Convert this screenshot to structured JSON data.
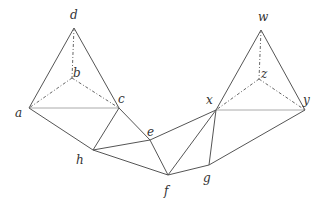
{
  "points": {
    "d": {
      "x": 74,
      "y": 28,
      "lx": 70,
      "ly": 8
    },
    "b": {
      "x": 72,
      "y": 78,
      "lx": 73,
      "ly": 66
    },
    "a": {
      "x": 29,
      "y": 108,
      "lx": 15,
      "ly": 106
    },
    "c": {
      "x": 119,
      "y": 108,
      "lx": 118,
      "ly": 92
    },
    "h": {
      "x": 93,
      "y": 150,
      "lx": 76,
      "ly": 153
    },
    "e": {
      "x": 150,
      "y": 140,
      "lx": 147,
      "ly": 125
    },
    "f": {
      "x": 168,
      "y": 175,
      "lx": 164,
      "ly": 184
    },
    "g": {
      "x": 209,
      "y": 165,
      "lx": 203,
      "ly": 171
    },
    "x": {
      "x": 216,
      "y": 110,
      "lx": 206,
      "ly": 93
    },
    "y": {
      "x": 305,
      "y": 110,
      "lx": 303,
      "ly": 93
    },
    "w": {
      "x": 261,
      "y": 30,
      "lx": 258,
      "ly": 10
    },
    "z": {
      "x": 259,
      "y": 79,
      "lx": 261,
      "ly": 67
    }
  },
  "labels": [
    "d",
    "b",
    "a",
    "c",
    "h",
    "e",
    "f",
    "g",
    "x",
    "y",
    "w",
    "z"
  ],
  "edges_solid": [
    [
      "a",
      "d"
    ],
    [
      "d",
      "c"
    ],
    [
      "a",
      "h"
    ],
    [
      "h",
      "c"
    ],
    [
      "c",
      "e"
    ],
    [
      "h",
      "e"
    ],
    [
      "h",
      "f"
    ],
    [
      "e",
      "f"
    ],
    [
      "e",
      "x"
    ],
    [
      "x",
      "f"
    ],
    [
      "x",
      "g"
    ],
    [
      "f",
      "g"
    ],
    [
      "g",
      "y"
    ],
    [
      "x",
      "w"
    ],
    [
      "w",
      "y"
    ]
  ],
  "edges_light": [
    [
      "a",
      "c"
    ],
    [
      "x",
      "y"
    ]
  ],
  "edges_dashed": [
    [
      "d",
      "b"
    ],
    [
      "b",
      "a"
    ],
    [
      "b",
      "c"
    ],
    [
      "w",
      "z"
    ],
    [
      "z",
      "x"
    ],
    [
      "z",
      "y"
    ]
  ],
  "colors": {
    "line": "#555555",
    "light": "#aaaaaa",
    "dash": "#666666"
  }
}
